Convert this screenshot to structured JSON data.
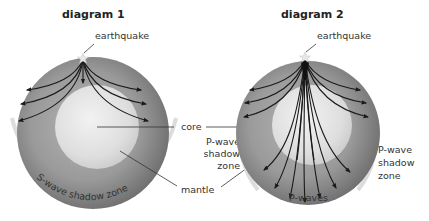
{
  "diagrams": [
    {
      "title": "diagram 1",
      "earthquake_label": "earthquake",
      "shadow_label": "S-wave shadow zone"
    },
    {
      "title": "diagram 2",
      "earthquake_label": "earthquake",
      "shadow_label_lines": [
        "P-wave",
        "shadow",
        "zone"
      ],
      "waves_label": "P-waves"
    }
  ],
  "shared_labels": {
    "core": "core",
    "p_shadow_lines": [
      "P-wave",
      "shadow",
      "zone"
    ],
    "mantle": "mantle"
  },
  "colors": {
    "mantle_outer": "#6e6e6e",
    "mantle_inner": "#a8a8a8",
    "core": "#e0e0e0",
    "rays": "#1a1a1a",
    "shadow_arc": "#dcdcdc"
  }
}
